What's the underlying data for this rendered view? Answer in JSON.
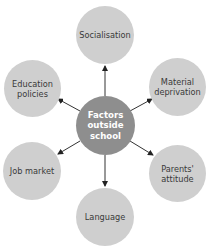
{
  "diagram": {
    "type": "spider",
    "center": {
      "label_lines": [
        "Factors",
        "outside",
        "school"
      ],
      "color": "#8e8e8e"
    },
    "node_color": "#cfcfcf",
    "nodes": [
      {
        "id": "socialisation",
        "label_lines": [
          "Socialisation"
        ]
      },
      {
        "id": "education-policies",
        "label_lines": [
          "Education",
          "policies"
        ]
      },
      {
        "id": "material-deprivation",
        "label_lines": [
          "Material",
          "deprivation"
        ]
      },
      {
        "id": "job-market",
        "label_lines": [
          "Job market"
        ]
      },
      {
        "id": "parents-attitude",
        "label_lines": [
          "Parents'",
          "attitude"
        ]
      },
      {
        "id": "language",
        "label_lines": [
          "Language"
        ]
      }
    ]
  }
}
